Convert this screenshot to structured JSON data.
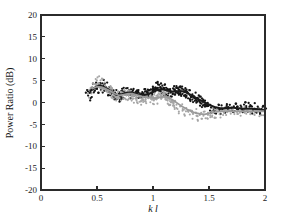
{
  "figure": {
    "background_color": "#ffffff",
    "axis_color": "#2b2b2b"
  },
  "chart_data": {
    "type": "scatter",
    "title": "",
    "subtitle": "",
    "xlabel": "k l",
    "ylabel": "Power Ratio (dB)",
    "xlim": [
      0,
      2
    ],
    "ylim": [
      -20,
      20
    ],
    "xticks": [
      0,
      0.5,
      1,
      1.5,
      2
    ],
    "xticklabels": [
      "0",
      "0.5",
      "1",
      "1.5",
      "2"
    ],
    "yticks": [
      -20,
      -15,
      -10,
      -5,
      0,
      5,
      10,
      15,
      20
    ],
    "yticklabels": [
      "-20",
      "-15",
      "-10",
      "-5",
      "0",
      "5",
      "10",
      "15",
      "20"
    ],
    "grid": false,
    "legend": "none",
    "annotations": [],
    "colors": {
      "series_dark": "#141414",
      "series_gray": "#a6a6a6",
      "trend_dark": "#1a1a1a",
      "trend_gray": "#9a9a9a"
    },
    "series": [
      {
        "name": "dark-trend",
        "style": "line",
        "color": "#1a1a1a",
        "x": [
          0.44,
          0.48,
          0.52,
          0.56,
          0.6,
          0.64,
          0.68,
          0.72,
          0.76,
          0.8,
          0.84,
          0.88,
          0.92,
          0.96,
          1.0,
          1.04,
          1.08,
          1.12,
          1.16,
          1.2,
          1.24,
          1.28,
          1.32,
          1.36,
          1.4,
          1.44,
          1.48,
          1.52,
          1.56,
          1.6,
          1.64,
          1.68,
          1.72,
          1.76,
          1.8,
          1.84,
          1.88,
          1.92,
          1.96,
          2.0
        ],
        "y": [
          2.6,
          3.4,
          3.9,
          3.6,
          3.0,
          2.3,
          1.7,
          1.9,
          2.2,
          2.3,
          2.1,
          1.8,
          1.7,
          1.9,
          2.4,
          2.9,
          3.0,
          2.8,
          2.5,
          2.5,
          2.6,
          2.5,
          2.0,
          1.4,
          0.8,
          0.3,
          -0.2,
          -0.7,
          -1.1,
          -1.3,
          -1.3,
          -1.2,
          -1.2,
          -1.3,
          -1.4,
          -1.4,
          -1.4,
          -1.5,
          -1.6,
          -1.8
        ]
      },
      {
        "name": "gray-trend",
        "style": "line",
        "color": "#9a9a9a",
        "x": [
          0.46,
          0.5,
          0.54,
          0.58,
          0.62,
          0.66,
          0.7,
          0.74,
          0.78,
          0.82,
          0.86,
          0.9,
          0.94,
          0.98,
          1.02,
          1.06,
          1.1,
          1.14,
          1.18,
          1.22,
          1.26,
          1.3,
          1.34,
          1.38,
          1.42,
          1.46,
          1.5,
          1.54,
          1.58,
          1.62,
          1.66,
          1.7,
          1.74,
          1.78,
          1.82,
          1.86,
          1.9,
          1.94,
          1.98,
          2.0
        ],
        "y": [
          3.2,
          3.6,
          3.5,
          3.1,
          2.6,
          2.0,
          1.6,
          1.8,
          2.0,
          2.0,
          1.7,
          1.4,
          1.2,
          1.1,
          1.0,
          1.2,
          1.4,
          1.1,
          0.5,
          -0.2,
          -0.9,
          -1.5,
          -2.0,
          -2.4,
          -2.6,
          -2.7,
          -2.5,
          -2.3,
          -2.1,
          -2.0,
          -2.0,
          -2.0,
          -2.0,
          -2.0,
          -2.0,
          -2.0,
          -2.0,
          -2.0,
          -2.0,
          -2.0
        ]
      },
      {
        "name": "dark-scatter",
        "style": "points",
        "color": "#141414",
        "x": [
          0.41,
          0.43,
          0.45,
          0.45,
          0.47,
          0.48,
          0.49,
          0.5,
          0.51,
          0.52,
          0.53,
          0.54,
          0.55,
          0.56,
          0.57,
          0.58,
          0.59,
          0.6,
          0.61,
          0.62,
          0.63,
          0.64,
          0.65,
          0.66,
          0.67,
          0.68,
          0.69,
          0.7,
          0.71,
          0.72,
          0.73,
          0.74,
          0.75,
          0.76,
          0.77,
          0.78,
          0.79,
          0.8,
          0.81,
          0.82,
          0.83,
          0.84,
          0.85,
          0.86,
          0.87,
          0.88,
          0.89,
          0.9,
          0.91,
          0.92,
          0.93,
          0.94,
          0.95,
          0.96,
          0.97,
          0.98,
          0.99,
          1.0,
          1.01,
          1.02,
          1.03,
          1.04,
          1.05,
          1.06,
          1.07,
          1.08,
          1.09,
          1.1,
          1.11,
          1.12,
          1.13,
          1.14,
          1.15,
          1.16,
          1.17,
          1.18,
          1.19,
          1.2,
          1.21,
          1.22,
          1.23,
          1.24,
          1.25,
          1.26,
          1.27,
          1.28,
          1.29,
          1.3,
          1.31,
          1.32,
          1.33,
          1.34,
          1.35,
          1.36,
          1.37,
          1.38,
          1.39,
          1.4,
          1.41,
          1.42,
          1.43,
          1.44,
          1.45,
          1.46,
          1.47,
          1.48,
          1.49,
          1.5,
          1.52,
          1.54,
          1.56,
          1.58,
          1.6,
          1.62,
          1.64,
          1.66,
          1.68,
          1.7,
          1.72,
          1.74,
          1.76,
          1.78,
          1.8,
          1.82,
          1.84,
          1.86,
          1.88,
          1.9,
          1.92,
          1.94,
          1.96,
          1.98,
          2.0
        ],
        "y": [
          2.2,
          1.4,
          3.0,
          1.8,
          3.6,
          2.9,
          4.2,
          3.8,
          3.1,
          4.4,
          3.5,
          4.0,
          3.2,
          4.3,
          3.4,
          2.8,
          3.6,
          2.4,
          3.1,
          2.0,
          2.7,
          1.6,
          2.3,
          1.2,
          1.9,
          0.9,
          1.6,
          1.1,
          2.0,
          1.5,
          2.4,
          1.8,
          2.6,
          2.1,
          2.9,
          2.3,
          1.8,
          2.6,
          1.9,
          2.8,
          2.1,
          1.6,
          2.4,
          1.4,
          2.1,
          1.3,
          1.9,
          1.2,
          2.0,
          1.5,
          2.3,
          1.7,
          2.5,
          1.9,
          2.8,
          2.2,
          3.0,
          2.4,
          3.3,
          2.7,
          3.6,
          2.9,
          3.8,
          3.1,
          3.5,
          2.6,
          3.4,
          2.5,
          3.2,
          2.3,
          3.0,
          2.1,
          2.9,
          2.0,
          2.8,
          2.2,
          3.1,
          2.4,
          3.2,
          2.6,
          3.3,
          2.5,
          3.1,
          2.3,
          2.9,
          2.0,
          2.6,
          1.7,
          2.3,
          1.4,
          2.0,
          1.1,
          1.7,
          0.8,
          1.4,
          0.5,
          1.1,
          0.2,
          0.8,
          -0.1,
          0.5,
          -0.4,
          0.2,
          -0.7,
          -0.1,
          -1.0,
          -0.4,
          -1.2,
          -1.5,
          -1.1,
          -1.6,
          -1.2,
          -1.7,
          -1.0,
          -1.5,
          -0.8,
          -1.4,
          -0.9,
          -1.6,
          -1.0,
          -1.5,
          -0.7,
          -1.3,
          -0.6,
          -1.4,
          -0.8,
          -1.6,
          -1.1,
          -1.8,
          -1.2,
          -1.9,
          -1.4,
          -2.0
        ]
      },
      {
        "name": "gray-scatter",
        "style": "points",
        "color": "#a6a6a6",
        "x": [
          0.42,
          0.44,
          0.46,
          0.47,
          0.49,
          0.5,
          0.51,
          0.52,
          0.53,
          0.54,
          0.55,
          0.56,
          0.57,
          0.58,
          0.59,
          0.6,
          0.61,
          0.62,
          0.63,
          0.64,
          0.65,
          0.66,
          0.67,
          0.68,
          0.69,
          0.7,
          0.71,
          0.72,
          0.73,
          0.74,
          0.75,
          0.76,
          0.77,
          0.78,
          0.79,
          0.8,
          0.81,
          0.82,
          0.83,
          0.84,
          0.85,
          0.86,
          0.87,
          0.88,
          0.89,
          0.9,
          0.91,
          0.92,
          0.93,
          0.94,
          0.95,
          0.96,
          0.97,
          0.98,
          0.99,
          1.0,
          1.01,
          1.02,
          1.03,
          1.04,
          1.05,
          1.06,
          1.07,
          1.08,
          1.09,
          1.1,
          1.11,
          1.12,
          1.13,
          1.14,
          1.15,
          1.16,
          1.17,
          1.18,
          1.19,
          1.2,
          1.22,
          1.24,
          1.26,
          1.28,
          1.3,
          1.32,
          1.34,
          1.36,
          1.38,
          1.4,
          1.42,
          1.44,
          1.46,
          1.48,
          1.5,
          1.52,
          1.54,
          1.56,
          1.58,
          1.6,
          1.63,
          1.66,
          1.69,
          1.72,
          1.75,
          1.78,
          1.81,
          1.84,
          1.87,
          1.9,
          1.93,
          1.96,
          1.99
        ],
        "y": [
          2.0,
          2.8,
          4.0,
          3.3,
          4.6,
          3.9,
          5.2,
          4.3,
          3.6,
          4.8,
          3.4,
          4.1,
          3.0,
          3.8,
          2.7,
          3.4,
          2.3,
          3.0,
          2.0,
          2.6,
          1.5,
          2.2,
          1.1,
          1.8,
          0.9,
          1.7,
          1.3,
          2.1,
          1.6,
          2.4,
          1.8,
          2.5,
          1.5,
          2.2,
          1.2,
          1.9,
          1.0,
          1.8,
          0.8,
          1.5,
          0.6,
          1.3,
          0.5,
          1.1,
          0.4,
          1.0,
          0.3,
          1.2,
          0.6,
          1.4,
          0.7,
          1.5,
          0.9,
          1.6,
          0.4,
          1.1,
          0.2,
          1.3,
          0.5,
          1.6,
          0.8,
          1.8,
          1.0,
          2.0,
          1.2,
          1.7,
          0.9,
          1.4,
          0.3,
          0.9,
          -0.2,
          0.4,
          -0.6,
          0.1,
          -1.0,
          -0.3,
          -1.3,
          -1.8,
          -1.1,
          -2.2,
          -1.5,
          -2.6,
          -1.9,
          -3.0,
          -2.2,
          -3.4,
          -2.5,
          -3.6,
          -2.8,
          -3.3,
          -2.4,
          -3.0,
          -2.1,
          -2.7,
          -1.9,
          -2.5,
          -2.0,
          -2.4,
          -1.8,
          -2.3,
          -1.7,
          -2.2,
          -1.9,
          -2.4,
          -1.8,
          -2.2,
          -1.9,
          -2.3,
          -2.0
        ]
      }
    ]
  }
}
